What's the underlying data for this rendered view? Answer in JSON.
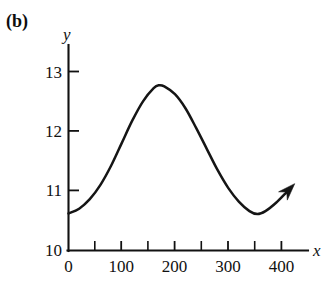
{
  "panel": {
    "label": "(b)"
  },
  "chart_data": {
    "type": "line",
    "title": "",
    "subtitle": "",
    "xlabel": "x",
    "ylabel": "y",
    "xlim": [
      0,
      450
    ],
    "ylim": [
      10,
      13.3
    ],
    "grid": false,
    "legend": null,
    "annotations": [
      {
        "kind": "arrowhead",
        "at_end_of_curve": true,
        "direction": "up-right",
        "description": "arrowhead at the right end of the curve indicating the curve continues rising"
      }
    ],
    "x_ticks_major": [
      0,
      100,
      200,
      300,
      400
    ],
    "x_tick_labels": [
      "0",
      "100",
      "200",
      "300",
      "400"
    ],
    "x_ticks_minor": [
      50,
      150,
      250,
      350
    ],
    "y_ticks_major": [
      10,
      11,
      12,
      13
    ],
    "y_tick_labels": [
      "10",
      "11",
      "12",
      "13"
    ],
    "series": [
      {
        "name": "curve",
        "color": "#151515",
        "x": [
          0,
          20,
          40,
          60,
          80,
          100,
          120,
          140,
          160,
          170,
          180,
          200,
          220,
          240,
          260,
          280,
          300,
          320,
          340,
          355,
          370,
          390,
          410,
          425
        ],
        "y": [
          10.62,
          10.7,
          10.86,
          11.1,
          11.42,
          11.8,
          12.18,
          12.5,
          12.72,
          12.77,
          12.75,
          12.62,
          12.38,
          12.05,
          11.7,
          11.35,
          11.05,
          10.82,
          10.66,
          10.61,
          10.66,
          10.8,
          10.98,
          11.12
        ]
      }
    ],
    "features": {
      "start_point": {
        "x": 0,
        "y": 10.62
      },
      "maximum": {
        "x": 170,
        "y": 12.77
      },
      "minimum": {
        "x": 355,
        "y": 10.61
      },
      "end_point": {
        "x": 425,
        "y": 11.12
      }
    }
  },
  "axes": {
    "x_axis_name": "x-axis",
    "y_axis_name": "y-axis"
  }
}
